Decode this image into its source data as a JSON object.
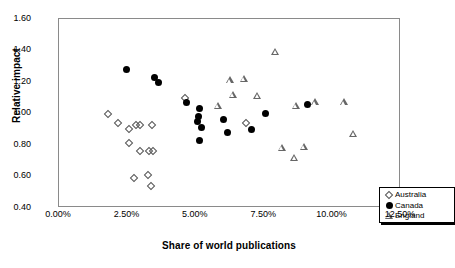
{
  "chart_data": {
    "type": "scatter",
    "title": "",
    "xlabel": "Share of world publications",
    "ylabel": "Relative impact",
    "xlim": [
      0,
      12.5
    ],
    "ylim": [
      0.4,
      1.6
    ],
    "xticks": [
      "0.00%",
      "2.50%",
      "5.00%",
      "7.50%",
      "10.00%",
      "12.50%"
    ],
    "xtick_values": [
      0,
      2.5,
      5.0,
      7.5,
      10.0,
      12.5
    ],
    "yticks": [
      "0.40",
      "0.60",
      "0.80",
      "1.00",
      "1.20",
      "1.40",
      "1.60"
    ],
    "ytick_values": [
      0.4,
      0.6,
      0.8,
      1.0,
      1.2,
      1.4,
      1.6
    ],
    "grid": false,
    "legend_position": "bottom-right",
    "xunit": "%",
    "series": [
      {
        "name": "Australia",
        "marker": "open-diamond",
        "color": "#555555",
        "points": [
          {
            "x": 1.8,
            "y": 1.0
          },
          {
            "x": 2.15,
            "y": 0.94
          },
          {
            "x": 2.55,
            "y": 0.9
          },
          {
            "x": 2.8,
            "y": 0.93
          },
          {
            "x": 2.95,
            "y": 0.93
          },
          {
            "x": 3.4,
            "y": 0.93
          },
          {
            "x": 2.55,
            "y": 0.81
          },
          {
            "x": 2.95,
            "y": 0.76
          },
          {
            "x": 3.3,
            "y": 0.76
          },
          {
            "x": 3.45,
            "y": 0.76
          },
          {
            "x": 2.75,
            "y": 0.59
          },
          {
            "x": 3.25,
            "y": 0.61
          },
          {
            "x": 3.35,
            "y": 0.54
          },
          {
            "x": 4.6,
            "y": 1.1
          },
          {
            "x": 6.85,
            "y": 0.94
          }
        ]
      },
      {
        "name": "Canada",
        "marker": "filled-circle",
        "color": "#000000",
        "points": [
          {
            "x": 2.45,
            "y": 1.28
          },
          {
            "x": 3.5,
            "y": 1.23
          },
          {
            "x": 3.65,
            "y": 1.2
          },
          {
            "x": 4.65,
            "y": 1.07
          },
          {
            "x": 5.15,
            "y": 1.03
          },
          {
            "x": 5.1,
            "y": 0.98
          },
          {
            "x": 5.05,
            "y": 0.95
          },
          {
            "x": 5.2,
            "y": 0.91
          },
          {
            "x": 5.15,
            "y": 0.83
          },
          {
            "x": 6.0,
            "y": 0.96
          },
          {
            "x": 6.15,
            "y": 0.88
          },
          {
            "x": 7.05,
            "y": 0.9
          },
          {
            "x": 7.55,
            "y": 1.0
          },
          {
            "x": 9.1,
            "y": 1.06
          }
        ]
      },
      {
        "name": "England",
        "marker": "open-triangle",
        "color": "#666666",
        "points": [
          {
            "x": 6.25,
            "y": 1.21
          },
          {
            "x": 6.75,
            "y": 1.22
          },
          {
            "x": 7.9,
            "y": 1.39
          },
          {
            "x": 6.35,
            "y": 1.12
          },
          {
            "x": 7.25,
            "y": 1.11
          },
          {
            "x": 8.65,
            "y": 1.05
          },
          {
            "x": 9.35,
            "y": 1.07
          },
          {
            "x": 10.4,
            "y": 1.07
          },
          {
            "x": 5.8,
            "y": 1.05
          },
          {
            "x": 8.15,
            "y": 0.78
          },
          {
            "x": 8.6,
            "y": 0.72
          },
          {
            "x": 8.95,
            "y": 0.79
          },
          {
            "x": 10.75,
            "y": 0.87
          }
        ]
      }
    ]
  },
  "legend": {
    "items": [
      {
        "label": "Australia",
        "marker": "open-diamond"
      },
      {
        "label": "Canada",
        "marker": "filled-circle"
      },
      {
        "label": "England",
        "marker": "open-triangle"
      }
    ]
  }
}
